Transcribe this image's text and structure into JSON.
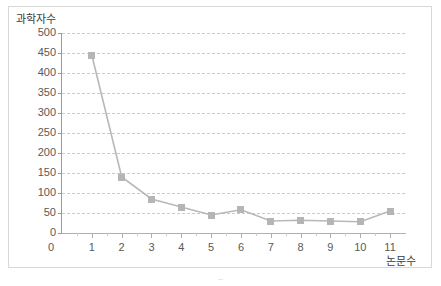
{
  "chart_data": {
    "type": "line",
    "title": "",
    "xlabel": "논문수",
    "ylabel": "과학자수",
    "x": [
      1,
      2,
      3,
      4,
      5,
      6,
      7,
      8,
      9,
      10,
      11
    ],
    "values": [
      445,
      140,
      85,
      65,
      45,
      58,
      30,
      32,
      30,
      28,
      55
    ],
    "series": [
      {
        "name": "과학자수",
        "values": [
          445,
          140,
          85,
          65,
          45,
          58,
          30,
          32,
          30,
          28,
          55
        ]
      }
    ],
    "xlim": [
      0,
      11.5
    ],
    "ylim": [
      0,
      500
    ],
    "ytick_labels": [
      "500",
      "450",
      "400",
      "350",
      "300",
      "250",
      "200",
      "150",
      "100",
      "50",
      "0"
    ],
    "ytick_values": [
      500,
      450,
      400,
      350,
      300,
      250,
      200,
      150,
      100,
      50,
      0
    ],
    "xtick_labels": [
      "1",
      "2",
      "3",
      "4",
      "5",
      "6",
      "7",
      "8",
      "9",
      "10",
      "11"
    ],
    "x_origin_label": "0",
    "grid": "horizontal-dashed",
    "legend": "none",
    "marker": "square",
    "line_color": "#b8b8b8",
    "marker_color": "#b5b5b5",
    "grid_color": "#c9c9c9",
    "axis_color": "#9a9a9a",
    "text_color": "#595959"
  },
  "caption": {
    "text": "–"
  }
}
